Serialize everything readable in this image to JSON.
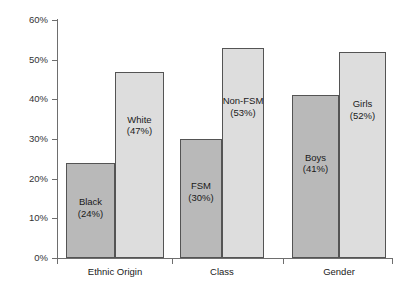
{
  "chart_data": {
    "type": "bar",
    "title": "",
    "subtitle": "",
    "xlabel": "",
    "ylabel": "",
    "ylim": [
      0,
      60
    ],
    "yticks": [
      0,
      10,
      20,
      30,
      40,
      50,
      60
    ],
    "ytick_labels": [
      "0%",
      "10%",
      "20%",
      "30%",
      "40%",
      "50%",
      "60%"
    ],
    "grid": false,
    "legend": "none",
    "categories": [
      "Ethnic Origin",
      "Class",
      "Gender"
    ],
    "bars": [
      {
        "group": "Ethnic Origin",
        "name": "Black",
        "value": 24,
        "value_label": "(24%)",
        "shade": "dark",
        "color": "#b9b9b9"
      },
      {
        "group": "Ethnic Origin",
        "name": "White",
        "value": 47,
        "value_label": "(47%)",
        "shade": "light",
        "color": "#dddddd"
      },
      {
        "group": "Class",
        "name": "FSM",
        "value": 30,
        "value_label": "(30%)",
        "shade": "dark",
        "color": "#b9b9b9"
      },
      {
        "group": "Class",
        "name": "Non-FSM",
        "value": 53,
        "value_label": "(53%)",
        "shade": "light",
        "color": "#dddddd"
      },
      {
        "group": "Gender",
        "name": "Boys",
        "value": 41,
        "value_label": "(41%)",
        "shade": "dark",
        "color": "#b9b9b9"
      },
      {
        "group": "Gender",
        "name": "Girls",
        "value": 52,
        "value_label": "(52%)",
        "shade": "light",
        "color": "#dddddd"
      }
    ],
    "series": [
      {
        "name": "lower-attaining group",
        "values": [
          24,
          30,
          41
        ]
      },
      {
        "name": "higher-attaining group",
        "values": [
          47,
          53,
          52
        ]
      }
    ],
    "axis_color": "#6e6e6e",
    "bar_border_color": "#545454"
  }
}
